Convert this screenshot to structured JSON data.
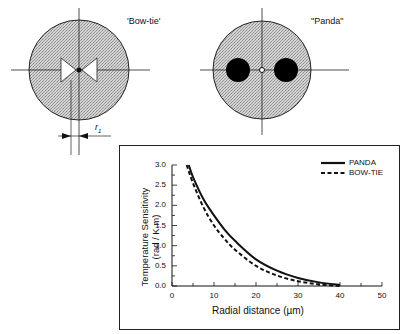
{
  "diagrams": {
    "bowtie": {
      "label": "'Bow-tie'"
    },
    "panda": {
      "label": "\"Panda\""
    },
    "dimension_label": "r1",
    "dimension_label_main": "r",
    "dimension_label_sub": "1"
  },
  "colors": {
    "cladding_fill": "#c8c8c8",
    "stress_rod": "#000000",
    "line": "#111111",
    "background": "#ffffff"
  },
  "chart_data": {
    "type": "line",
    "title": "",
    "xlabel": "Radial distance (µm)",
    "ylabel": "Temperature Sensitivity (rad / K.m)",
    "ylabel_line1": "Temperature Sensitivity",
    "ylabel_line2": "(rad / K.m)",
    "xlim": [
      0,
      50
    ],
    "ylim": [
      0,
      3.0
    ],
    "x_ticks": [
      "0",
      "10",
      "20",
      "30",
      "40",
      "50"
    ],
    "y_ticks": [
      "0.0",
      "0.5",
      "1.0",
      "1.5",
      "2.0",
      "2.5",
      "3.0"
    ],
    "grid": false,
    "legend_position": "top-right",
    "series": [
      {
        "name": "PANDA",
        "style": "solid",
        "x": [
          4,
          5,
          7.5,
          10,
          12.5,
          15,
          20,
          25,
          30,
          35,
          40
        ],
        "y": [
          3.0,
          2.7,
          2.15,
          1.75,
          1.4,
          1.12,
          0.66,
          0.38,
          0.2,
          0.09,
          0.03
        ]
      },
      {
        "name": "BOW-TIE",
        "style": "dashed",
        "x": [
          3.5,
          5,
          7.5,
          10,
          12.5,
          15,
          20,
          25,
          30,
          35,
          40
        ],
        "y": [
          3.0,
          2.55,
          1.95,
          1.5,
          1.17,
          0.9,
          0.5,
          0.26,
          0.12,
          0.04,
          0.0
        ]
      }
    ]
  }
}
